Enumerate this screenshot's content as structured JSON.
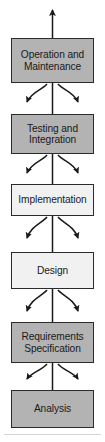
{
  "diagram": {
    "type": "flow-diagram",
    "orientation": "bottom-to-top",
    "colors": {
      "box_fill_shaded": "#b3b3b3",
      "box_fill_light": "#f1f1f1",
      "box_border": "#2b2b2b",
      "arrow": "#1a1a1a",
      "background": "#ffffff",
      "rule": "#d6d6d6"
    },
    "stages": [
      {
        "id": "operation-and-maintenance",
        "label": "Operation and Maintenance",
        "line1": "Operation and",
        "line2": "Maintenance",
        "fill": "shaded",
        "x": 11,
        "y": 38,
        "width": 83,
        "height": 45
      },
      {
        "id": "testing-and-integration",
        "label": "Testing and Integration",
        "line1": "Testing and",
        "line2": "Integration",
        "fill": "shaded",
        "x": 11,
        "y": 114,
        "width": 83,
        "height": 40
      },
      {
        "id": "implementation",
        "label": "Implementation",
        "line1": "Implementation",
        "line2": "",
        "fill": "light",
        "x": 11,
        "y": 184,
        "width": 83,
        "height": 32
      },
      {
        "id": "design",
        "label": "Design",
        "line1": "Design",
        "line2": "",
        "fill": "light",
        "x": 11,
        "y": 252,
        "width": 83,
        "height": 37
      },
      {
        "id": "requirements-specification",
        "label": "Requirements Specification",
        "line1": "Requirements",
        "line2": "Specification",
        "fill": "shaded",
        "x": 11,
        "y": 322,
        "width": 83,
        "height": 41
      },
      {
        "id": "analysis",
        "label": "Analysis",
        "line1": "Analysis",
        "line2": "",
        "fill": "shaded",
        "x": 11,
        "y": 390,
        "width": 83,
        "height": 38
      }
    ],
    "connectors": {
      "spine_label": "vertical-upward-spine",
      "top_arrow_label": "upward-arrow-head",
      "feedback_label": "curved-feedback-arrow"
    },
    "footer_rule": {
      "label": "horizontal-divider",
      "y": 434
    }
  }
}
